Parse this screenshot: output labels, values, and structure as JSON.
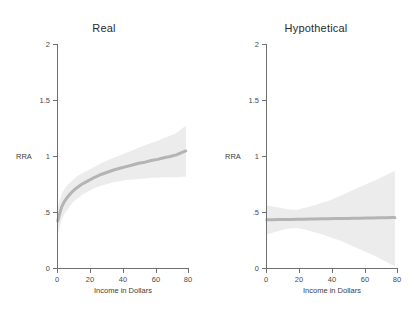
{
  "chart_data": [
    {
      "type": "line",
      "title": "Real",
      "xlabel": "Income in Dollars",
      "ylabel": "RRA",
      "xlim": [
        0,
        84
      ],
      "ylim": [
        0,
        2
      ],
      "xticks": [
        0,
        20,
        40,
        60,
        80
      ],
      "xticklabels": [
        "0",
        "20",
        "40",
        "60",
        "80"
      ],
      "yticks": [
        0,
        0.5,
        1,
        1.5,
        2
      ],
      "yticklabels": [
        "0",
        ".5",
        "1",
        "1.5",
        "2"
      ],
      "grid": false,
      "legend": "none",
      "line_color": "#b4b4b4",
      "band_color": "#ececec",
      "x": [
        0.5,
        1,
        2,
        3,
        4,
        5,
        6,
        8,
        10,
        12,
        14,
        16,
        18,
        20,
        24,
        28,
        32,
        36,
        40,
        44,
        48,
        52,
        56,
        60,
        64,
        68,
        72,
        76,
        80,
        82
      ],
      "y": [
        0.42,
        0.45,
        0.5,
        0.545,
        0.575,
        0.6,
        0.62,
        0.655,
        0.685,
        0.71,
        0.73,
        0.75,
        0.765,
        0.78,
        0.81,
        0.835,
        0.855,
        0.875,
        0.89,
        0.905,
        0.92,
        0.935,
        0.945,
        0.96,
        0.97,
        0.985,
        0.995,
        1.01,
        1.035,
        1.045
      ],
      "band_lower": [
        0.3,
        0.33,
        0.38,
        0.43,
        0.46,
        0.49,
        0.51,
        0.55,
        0.585,
        0.61,
        0.63,
        0.655,
        0.67,
        0.685,
        0.715,
        0.735,
        0.75,
        0.765,
        0.775,
        0.785,
        0.79,
        0.795,
        0.8,
        0.805,
        0.805,
        0.81,
        0.81,
        0.81,
        0.815,
        0.815
      ],
      "band_upper": [
        0.54,
        0.57,
        0.62,
        0.66,
        0.69,
        0.71,
        0.73,
        0.76,
        0.785,
        0.81,
        0.83,
        0.845,
        0.86,
        0.875,
        0.905,
        0.935,
        0.96,
        0.985,
        1.005,
        1.03,
        1.05,
        1.075,
        1.095,
        1.115,
        1.135,
        1.16,
        1.18,
        1.205,
        1.25,
        1.27
      ]
    },
    {
      "type": "line",
      "title": "Hypothetical",
      "xlabel": "Income in Dollars",
      "ylabel": "RRA",
      "xlim": [
        0,
        84
      ],
      "ylim": [
        0,
        2
      ],
      "xticks": [
        0,
        20,
        40,
        60,
        80
      ],
      "xticklabels": [
        "0",
        "20",
        "40",
        "60",
        "80"
      ],
      "yticks": [
        0,
        0.5,
        1,
        1.5,
        2
      ],
      "yticklabels": [
        "0",
        ".5",
        "1",
        "1.5",
        "2"
      ],
      "grid": false,
      "legend": "none",
      "line_color": "#b4b4b4",
      "band_color": "#ececec",
      "x": [
        0.5,
        4,
        8,
        12,
        16,
        20,
        24,
        28,
        32,
        36,
        40,
        44,
        48,
        52,
        56,
        60,
        64,
        68,
        72,
        76,
        80,
        82
      ],
      "y": [
        0.43,
        0.43,
        0.432,
        0.433,
        0.434,
        0.435,
        0.436,
        0.437,
        0.438,
        0.439,
        0.44,
        0.441,
        0.442,
        0.443,
        0.444,
        0.445,
        0.446,
        0.447,
        0.448,
        0.449,
        0.45,
        0.45
      ],
      "band_lower": [
        0.3,
        0.315,
        0.33,
        0.345,
        0.355,
        0.355,
        0.345,
        0.33,
        0.315,
        0.3,
        0.28,
        0.26,
        0.24,
        0.215,
        0.19,
        0.165,
        0.14,
        0.115,
        0.09,
        0.06,
        0.03,
        0.015
      ],
      "band_upper": [
        0.56,
        0.55,
        0.54,
        0.53,
        0.52,
        0.52,
        0.535,
        0.55,
        0.565,
        0.585,
        0.6,
        0.625,
        0.65,
        0.675,
        0.7,
        0.725,
        0.75,
        0.775,
        0.8,
        0.825,
        0.855,
        0.865
      ]
    }
  ],
  "panels": [
    {
      "title": "Real",
      "ylabel": "RRA",
      "xlabel": "Income in Dollars",
      "yticklabels": [
        "2",
        "1.5",
        "1",
        ".5",
        "0"
      ],
      "xticklabels": [
        "0",
        "20",
        "40",
        "60",
        "80"
      ]
    },
    {
      "title": "Hypothetical",
      "ylabel": "RRA",
      "xlabel": "Income in Dollars",
      "yticklabels": [
        "2",
        "1.5",
        "1",
        ".5",
        "0"
      ],
      "xticklabels": [
        "0",
        "20",
        "40",
        "60",
        "80"
      ]
    }
  ],
  "colors": {
    "axis": "#6f6f6f",
    "line": "#b4b4b4",
    "band": "#ececec",
    "text": "#3d3d3d",
    "background": "#ffffff"
  }
}
